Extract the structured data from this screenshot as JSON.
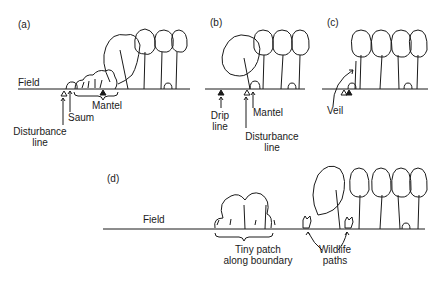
{
  "panels": {
    "a": {
      "tag": "(a)",
      "field": "Field",
      "labels": {
        "disturbance_line": [
          "Disturbance",
          "line"
        ],
        "saum": "Saum",
        "mantel": "Mantel"
      }
    },
    "b": {
      "tag": "(b)",
      "labels": {
        "drip_line": [
          "Drip",
          "line"
        ],
        "mantel": "Mantel",
        "disturbance_line": [
          "Disturbance",
          "line"
        ]
      }
    },
    "c": {
      "tag": "(c)",
      "labels": {
        "veil": "Veil"
      }
    },
    "d": {
      "tag": "(d)",
      "field": "Field",
      "labels": {
        "tiny_patch": [
          "Tiny patch",
          "along boundary"
        ],
        "wildlife_paths": [
          "Wildlife",
          "paths"
        ]
      }
    }
  },
  "legend_symbols": {
    "open-triangle": "disturbance line marker",
    "filled-triangle": "drip line / mantel marker"
  }
}
